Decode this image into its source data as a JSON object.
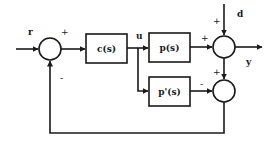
{
  "diagram": {
    "type": "block-diagram",
    "signals": {
      "reference": "r",
      "control": "u",
      "disturbance": "d",
      "output": "y"
    },
    "blocks": {
      "controller": "c(s)",
      "plant": "p(s)",
      "plant_model": "p'(s)"
    },
    "summing_junctions": {
      "input": {
        "plus": "+",
        "minus": "-"
      },
      "output": {
        "plant_input": "+",
        "disturbance_input": "+"
      },
      "model_error": {
        "output_input": "+",
        "model_input": "-"
      }
    },
    "connections": [
      {
        "from": "r",
        "to": "input-sum",
        "sign": "+"
      },
      {
        "from": "input-sum",
        "to": "c(s)"
      },
      {
        "from": "c(s)",
        "to": "u"
      },
      {
        "from": "u",
        "to": "p(s)"
      },
      {
        "from": "u",
        "to": "p'(s)"
      },
      {
        "from": "p(s)",
        "to": "output-sum",
        "sign": "+"
      },
      {
        "from": "d",
        "to": "output-sum",
        "sign": "+"
      },
      {
        "from": "output-sum",
        "to": "y"
      },
      {
        "from": "output-sum",
        "to": "model-error-sum",
        "sign": "+"
      },
      {
        "from": "p'(s)",
        "to": "model-error-sum",
        "sign": "-"
      },
      {
        "from": "model-error-sum",
        "to": "input-sum",
        "sign": "-"
      }
    ]
  }
}
